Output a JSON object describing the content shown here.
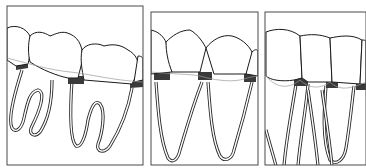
{
  "figure": {
    "type": "dental-illustration",
    "panels": [
      {
        "id": "panel-1",
        "subject": "molars with divergent roots",
        "teeth_visible": 3
      },
      {
        "id": "panel-2",
        "subject": "premolars with long single roots",
        "teeth_visible": 3
      },
      {
        "id": "panel-3",
        "subject": "anterior teeth with narrow roots",
        "teeth_visible": 4
      }
    ],
    "colors": {
      "line": "#1a1a1a",
      "band": "#3a3a3a",
      "bone_line": "#9a9a9a",
      "background": "#ffffff"
    }
  }
}
